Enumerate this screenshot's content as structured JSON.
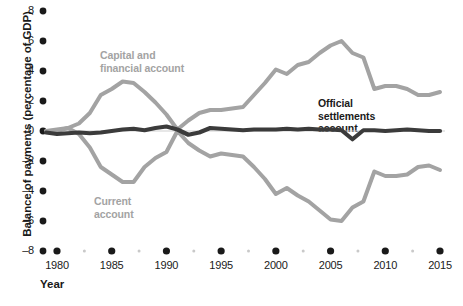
{
  "chart_data": {
    "type": "line",
    "title": "",
    "xlabel": "Year",
    "ylabel": "Balance of payments (percentage of GDP)",
    "xlim": [
      1979,
      2015.5
    ],
    "ylim": [
      -8,
      8
    ],
    "ytick_values": [
      8,
      6,
      4,
      2,
      0,
      -2,
      -4,
      -6,
      -8
    ],
    "ytick_labels": [
      "8",
      "6",
      "4",
      "2",
      "0",
      "–2",
      "–4",
      "–6",
      "–8"
    ],
    "xtick_values": [
      1980,
      1985,
      1990,
      1995,
      2000,
      2005,
      2010,
      2015
    ],
    "xtick_labels": [
      "1980",
      "1985",
      "1990",
      "1995",
      "2000",
      "2005",
      "2010",
      "2015"
    ],
    "xminor_values": [
      1982.5,
      1987.5,
      1992.5,
      1997.5,
      2002.5,
      2007.5,
      2012.5
    ],
    "grid": false,
    "legend_position": "inline-annotations",
    "colors": {
      "gray_series": "#a3a3a3",
      "dark_series": "#3b3b3b",
      "axis_text": "#1a1a1a",
      "zero_line": "#cfcfcf",
      "background": "#ffffff"
    },
    "annotations": [
      {
        "name": "capital-and-financial-account-label",
        "text": "Capital and\nfinancial account",
        "color": "#a3a3a3"
      },
      {
        "name": "current-account-label",
        "text": "Current\naccount",
        "color": "#a3a3a3"
      },
      {
        "name": "official-settlements-account-label",
        "text": "Official\nsettlements\naccount",
        "color": "#1a1a1a"
      }
    ],
    "x": [
      1979,
      1980,
      1981,
      1982,
      1983,
      1984,
      1985,
      1986,
      1987,
      1988,
      1989,
      1990,
      1991,
      1992,
      1993,
      1994,
      1995,
      1996,
      1997,
      1998,
      1999,
      2000,
      2001,
      2002,
      2003,
      2004,
      2005,
      2006,
      2007,
      2008,
      2009,
      2010,
      2011,
      2012,
      2013,
      2014,
      2015
    ],
    "series": [
      {
        "name": "Capital and financial account",
        "color": "#a3a3a3",
        "values": [
          0.0,
          0.0,
          0.2,
          0.5,
          1.2,
          2.4,
          2.8,
          3.3,
          3.2,
          2.6,
          1.9,
          1.1,
          0.1,
          0.7,
          1.2,
          1.4,
          1.4,
          1.5,
          1.6,
          2.4,
          3.2,
          4.1,
          3.8,
          4.4,
          4.6,
          5.2,
          5.7,
          6.0,
          5.2,
          4.9,
          2.8,
          3.0,
          3.0,
          2.8,
          2.4,
          2.4,
          2.6
        ]
      },
      {
        "name": "Current account",
        "color": "#a3a3a3",
        "values": [
          0.0,
          0.1,
          0.2,
          -0.2,
          -1.1,
          -2.4,
          -2.9,
          -3.4,
          -3.4,
          -2.4,
          -1.8,
          -1.4,
          0.0,
          -0.8,
          -1.3,
          -1.7,
          -1.5,
          -1.6,
          -1.7,
          -2.4,
          -3.2,
          -4.2,
          -3.8,
          -4.3,
          -4.7,
          -5.3,
          -5.9,
          -6.0,
          -5.1,
          -4.7,
          -2.7,
          -3.0,
          -3.0,
          -2.9,
          -2.4,
          -2.3,
          -2.6
        ]
      },
      {
        "name": "Official settlements account",
        "color": "#3b3b3b",
        "values": [
          -0.1,
          -0.2,
          -0.15,
          -0.1,
          -0.15,
          -0.1,
          0.0,
          0.1,
          0.15,
          0.05,
          0.2,
          0.3,
          0.1,
          -0.25,
          -0.1,
          0.2,
          0.15,
          0.1,
          0.05,
          0.1,
          0.1,
          0.1,
          0.15,
          0.1,
          0.15,
          0.1,
          0.1,
          0.05,
          -0.55,
          0.05,
          0.05,
          0.0,
          0.05,
          0.1,
          0.05,
          0.0,
          0.0
        ]
      }
    ]
  }
}
